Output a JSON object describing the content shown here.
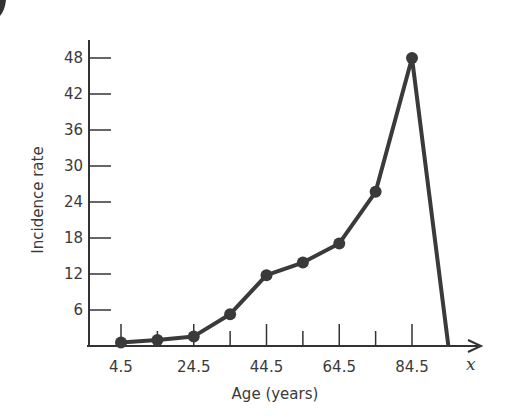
{
  "chart_data": {
    "type": "line",
    "title": "",
    "xlabel": "Age (years)",
    "ylabel": "Incidence rate",
    "x_axis_variable": "x",
    "x_tick_labels": [
      "4.5",
      "24.5",
      "44.5",
      "64.5",
      "84.5"
    ],
    "y_tick_labels": [
      "6",
      "12",
      "18",
      "24",
      "30",
      "36",
      "42",
      "48"
    ],
    "ylim": [
      0,
      50
    ],
    "xlim": [
      0,
      100
    ],
    "grid": false,
    "legend": null,
    "series": [
      {
        "name": "Incidence rate",
        "color": "#3a3a3a",
        "markers": true,
        "points": [
          {
            "x": 4.5,
            "y": 0.6
          },
          {
            "x": 14.5,
            "y": 1.0
          },
          {
            "x": 24.5,
            "y": 1.6
          },
          {
            "x": 34.5,
            "y": 5.3
          },
          {
            "x": 44.5,
            "y": 11.8
          },
          {
            "x": 54.5,
            "y": 13.9
          },
          {
            "x": 64.5,
            "y": 17.1
          },
          {
            "x": 74.5,
            "y": 25.7
          },
          {
            "x": 84.5,
            "y": 48.0
          }
        ],
        "end_point": {
          "x": 94.5,
          "y": 0
        }
      }
    ]
  }
}
